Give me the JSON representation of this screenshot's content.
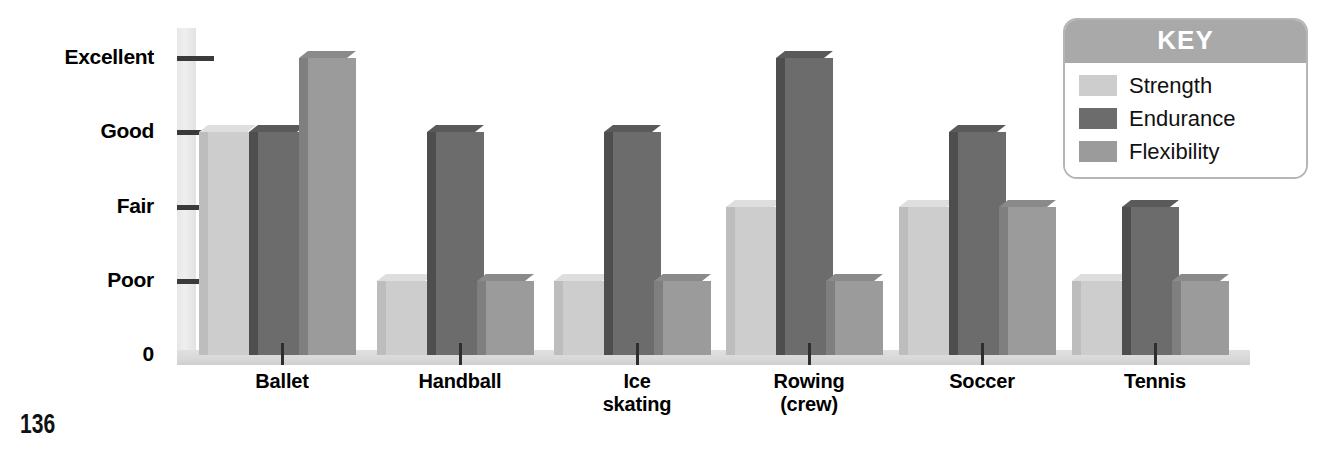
{
  "page": {
    "number": "136",
    "background_color": "#ffffff"
  },
  "legend": {
    "title": "KEY",
    "header_color": "#a9a9a9",
    "items": [
      {
        "label": "Strength",
        "color": "#cdcdcd"
      },
      {
        "label": "Endurance",
        "color": "#6c6c6c"
      },
      {
        "label": "Flexibility",
        "color": "#9b9b9b"
      }
    ]
  },
  "chart_data": {
    "type": "bar",
    "title": "",
    "subtitle": "",
    "xlabel": "",
    "ylabel": "",
    "grid": false,
    "legend_position": "top-right",
    "categories": [
      "Ballet",
      "Handball",
      "Ice\nskating",
      "Rowing\n(crew)",
      "Soccer",
      "Tennis"
    ],
    "y_tick_labels": [
      "Excellent",
      "Good",
      "Fair",
      "Poor",
      "0"
    ],
    "y_tick_values": [
      4,
      3,
      2,
      1,
      0
    ],
    "ylim": [
      0,
      4.2
    ],
    "series": [
      {
        "name": "Strength",
        "color": "#cdcdcd",
        "values": [
          3,
          1,
          1,
          2,
          2,
          1
        ],
        "value_labels": [
          "Good",
          "Poor",
          "Poor",
          "Fair",
          "Fair",
          "Poor"
        ]
      },
      {
        "name": "Endurance",
        "color": "#6c6c6c",
        "values": [
          3,
          3,
          3,
          4,
          3,
          2
        ],
        "value_labels": [
          "Good",
          "Good",
          "Good",
          "Excellent",
          "Good",
          "Fair"
        ]
      },
      {
        "name": "Flexibility",
        "color": "#9b9b9b",
        "values": [
          4,
          1,
          1,
          1,
          2,
          1
        ],
        "value_labels": [
          "Excellent",
          "Poor",
          "Poor",
          "Poor",
          "Fair",
          "Poor"
        ]
      }
    ]
  }
}
